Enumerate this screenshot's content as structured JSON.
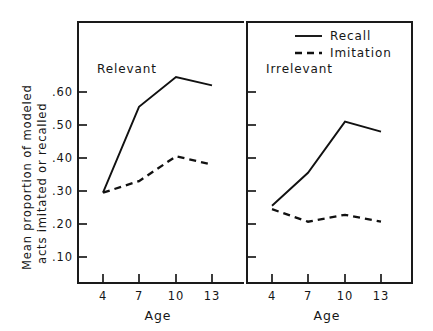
{
  "chart_data": {
    "type": "line",
    "title": "",
    "xlabel": "Age",
    "ylabel": "Mean proportion of modeled acts imitated or recalled",
    "ylabel_line1": "Mean proportion of modeled",
    "ylabel_line2": "acts imitated or recalled",
    "x": [
      4,
      7,
      10,
      13
    ],
    "xticklabels": [
      "4",
      "7",
      "10",
      "13"
    ],
    "yticks": [
      0.1,
      0.2,
      0.3,
      0.4,
      0.5,
      0.6
    ],
    "yticklabels": [
      ".10",
      ".20",
      ".30",
      ".40",
      ".50",
      ".60"
    ],
    "ylim": [
      0.045,
      0.685
    ],
    "xlim": [
      2.2,
      15.0
    ],
    "grid": false,
    "legend_position": "top-right",
    "legend": [
      "Recall",
      "Imitation"
    ],
    "panels": [
      {
        "name": "Relevant",
        "label": "Relevant",
        "series": [
          {
            "name": "Recall",
            "style": "solid",
            "values": [
              0.295,
              0.555,
              0.645,
              0.62
            ]
          },
          {
            "name": "Imitation",
            "style": "dashed",
            "values": [
              0.295,
              0.33,
              0.405,
              0.38
            ]
          }
        ]
      },
      {
        "name": "Irrelevant",
        "label": "Irrelevant",
        "series": [
          {
            "name": "Recall",
            "style": "solid",
            "values": [
              0.255,
              0.355,
              0.51,
              0.48
            ]
          },
          {
            "name": "Imitation",
            "style": "dashed",
            "values": [
              0.245,
              0.207,
              0.228,
              0.207
            ]
          }
        ]
      }
    ]
  },
  "figure": {
    "axis_color": "#161616",
    "line_color": "#111111",
    "background": "#ffffff"
  }
}
